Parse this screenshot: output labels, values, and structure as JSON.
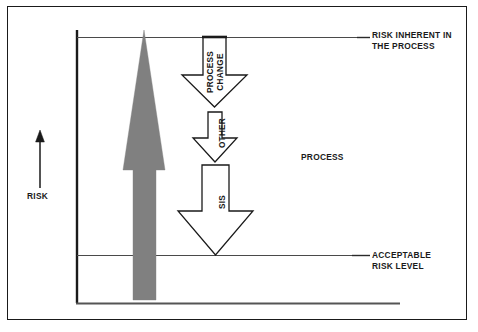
{
  "diagram": {
    "axis": {
      "y_axis_label": "RISK",
      "y_axis_arrow_icon": "up-arrow-icon"
    },
    "reference_lines": [
      {
        "id": "risk-inherent",
        "label_line_1": "RISK INHERENT IN",
        "label_line_2": "THE PROCESS",
        "y": 37
      },
      {
        "id": "acceptable-risk",
        "label_line_1": "ACCEPTABLE",
        "label_line_2": "RISK LEVEL",
        "y": 255
      }
    ],
    "region_label": "PROCESS",
    "risk_arrow": {
      "name": "risk-magnitude-arrow",
      "direction": "up",
      "fill_color": "#808080"
    },
    "layer_arrows": [
      {
        "id": "process-change",
        "label": "PROCESS\nCHANGE",
        "direction": "down",
        "fill_color": "#ffffff",
        "stroke_color": "#1a1a1a"
      },
      {
        "id": "other",
        "label": "OTHER",
        "direction": "down",
        "fill_color": "#ffffff",
        "stroke_color": "#1a1a1a"
      },
      {
        "id": "sis",
        "label": "SIS",
        "direction": "down",
        "fill_color": "#ffffff",
        "stroke_color": "#1a1a1a"
      }
    ],
    "colors": {
      "line": "#1a1a1a",
      "thin_line": "#4a4a4a",
      "gray_fill": "#808080",
      "background": "#ffffff"
    }
  }
}
